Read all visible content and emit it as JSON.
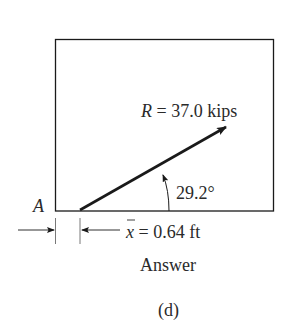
{
  "figure": {
    "resultant_label_var": "R",
    "resultant_label_value": " = 37.0 kips",
    "angle_label": "29.2°",
    "point_label": "A",
    "xbar_var": "x",
    "xbar_value": " = 0.64 ft",
    "caption_answer": "Answer",
    "subfigure_label": "(d)"
  },
  "geometry": {
    "box": {
      "x": 55,
      "y": 39,
      "width": 218,
      "height": 172
    },
    "resultant_angle_deg": 29.2,
    "resultant_magnitude_kips": 37.0,
    "xbar_ft": 0.64
  },
  "colors": {
    "ink": "#1a1a1a",
    "text": "#2a2a2a",
    "background": "#ffffff"
  }
}
